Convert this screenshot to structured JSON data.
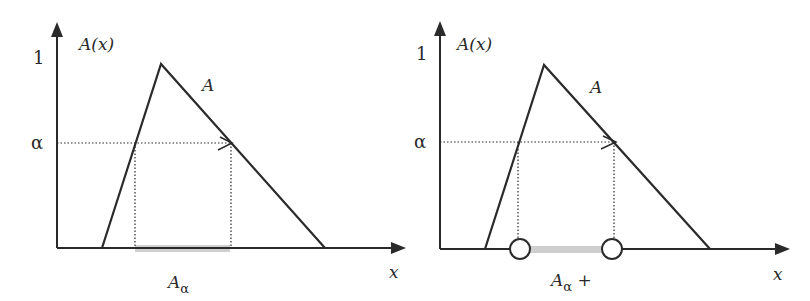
{
  "figure": {
    "panels": [
      {
        "id": "alpha-cut",
        "y_axis_label": "A(x)",
        "x_axis_label": "x",
        "y_tick_one": "1",
        "y_tick_alpha": "α",
        "set_label": "A",
        "cut_label_main": "A",
        "cut_label_sub": "α",
        "cut_label_suffix": "",
        "endpoints": "closed"
      },
      {
        "id": "strong-alpha-cut",
        "y_axis_label": "A(x)",
        "x_axis_label": "x",
        "y_tick_one": "1",
        "y_tick_alpha": "α",
        "set_label": "A",
        "cut_label_main": "A",
        "cut_label_sub": "α",
        "cut_label_suffix": " +",
        "endpoints": "open"
      }
    ],
    "colors": {
      "line": "#2a2a2a",
      "cut_bar": "#cfcfcf",
      "background": "#ffffff"
    }
  }
}
